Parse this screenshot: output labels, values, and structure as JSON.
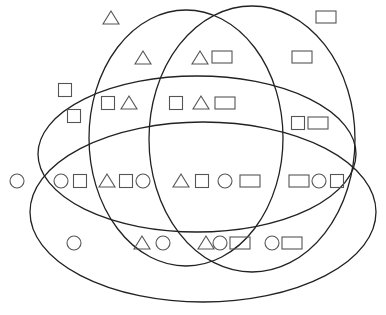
{
  "diagram": {
    "type": "venn-4-ellipses",
    "background": "#ffffff",
    "stroke_color": "#222222",
    "shape_stroke_color": "#555555",
    "sets": [
      {
        "id": "A",
        "name": "ellipse-left-vertical",
        "cx": 186,
        "cy": 138,
        "rx": 97,
        "ry": 128
      },
      {
        "id": "B",
        "name": "ellipse-right-vertical",
        "cx": 252,
        "cy": 139,
        "rx": 103,
        "ry": 133
      },
      {
        "id": "C",
        "name": "ellipse-upper-horizontal",
        "cx": 197,
        "cy": 154,
        "rx": 159,
        "ry": 78
      },
      {
        "id": "D",
        "name": "ellipse-lower-horizontal",
        "cx": 203,
        "cy": 212,
        "rx": 173,
        "ry": 90
      }
    ],
    "shapes": [
      {
        "kind": "triangle",
        "x": 111,
        "y": 18
      },
      {
        "kind": "rectangle",
        "x": 326,
        "y": 17
      },
      {
        "kind": "triangle",
        "x": 143,
        "y": 58
      },
      {
        "kind": "triangle",
        "x": 200,
        "y": 58
      },
      {
        "kind": "rectangle",
        "x": 222,
        "y": 57
      },
      {
        "kind": "rectangle",
        "x": 302,
        "y": 57
      },
      {
        "kind": "square",
        "x": 65,
        "y": 90
      },
      {
        "kind": "square",
        "x": 74,
        "y": 116
      },
      {
        "kind": "square",
        "x": 108,
        "y": 103
      },
      {
        "kind": "triangle",
        "x": 129,
        "y": 103
      },
      {
        "kind": "square",
        "x": 176,
        "y": 103
      },
      {
        "kind": "triangle",
        "x": 201,
        "y": 103
      },
      {
        "kind": "rectangle",
        "x": 225,
        "y": 103
      },
      {
        "kind": "square",
        "x": 298,
        "y": 123
      },
      {
        "kind": "rectangle",
        "x": 318,
        "y": 123
      },
      {
        "kind": "circle",
        "x": 17,
        "y": 181
      },
      {
        "kind": "circle",
        "x": 61,
        "y": 181
      },
      {
        "kind": "square",
        "x": 80,
        "y": 181
      },
      {
        "kind": "triangle",
        "x": 107,
        "y": 181
      },
      {
        "kind": "square",
        "x": 126,
        "y": 181
      },
      {
        "kind": "circle",
        "x": 143,
        "y": 181
      },
      {
        "kind": "triangle",
        "x": 181,
        "y": 181
      },
      {
        "kind": "square",
        "x": 202,
        "y": 181
      },
      {
        "kind": "circle",
        "x": 225,
        "y": 181
      },
      {
        "kind": "rectangle",
        "x": 250,
        "y": 181
      },
      {
        "kind": "rectangle",
        "x": 299,
        "y": 181
      },
      {
        "kind": "circle",
        "x": 319,
        "y": 181
      },
      {
        "kind": "square",
        "x": 337,
        "y": 181
      },
      {
        "kind": "circle",
        "x": 74,
        "y": 243
      },
      {
        "kind": "triangle",
        "x": 142,
        "y": 243
      },
      {
        "kind": "circle",
        "x": 163,
        "y": 243
      },
      {
        "kind": "triangle",
        "x": 206,
        "y": 243
      },
      {
        "kind": "circle",
        "x": 220,
        "y": 243
      },
      {
        "kind": "rectangle",
        "x": 240,
        "y": 243
      },
      {
        "kind": "circle",
        "x": 272,
        "y": 243
      },
      {
        "kind": "rectangle",
        "x": 292,
        "y": 243
      }
    ]
  }
}
